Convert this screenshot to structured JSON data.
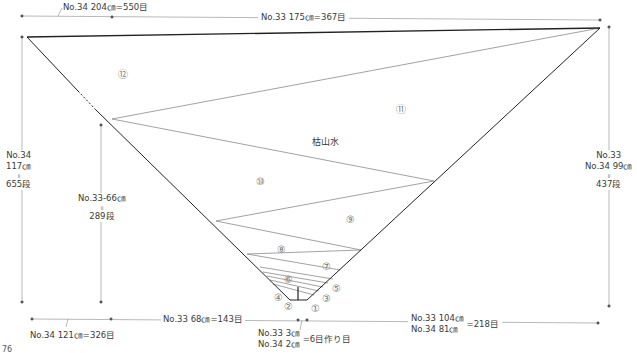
{
  "diagram": {
    "title": "枯山水",
    "page_number": "76",
    "top": {
      "left_label": "No.34  204㎝=550目",
      "right_label": "No.33  175㎝=367目"
    },
    "left_side": {
      "outer": {
        "line1": "No.34",
        "line2": "117㎝",
        "eq": "॥",
        "line3": "655段"
      },
      "inner": {
        "line1": "No.33-66㎝",
        "eq": "॥",
        "line2": "289段"
      }
    },
    "right_side": {
      "line1": "No.33",
      "line2": "No.34  99㎝",
      "eq": "॥",
      "line3": "437段"
    },
    "bottom": {
      "left_label": "No.34  121㎝=326目",
      "mid_label": "No.33  68㎝=143目",
      "cast_on": {
        "line1": "No.33  3㎝",
        "line2": "No.34  2㎝",
        "suffix": "=6目作り目"
      },
      "right": {
        "line1": "No.33  104㎝",
        "line2": "No.34  81㎝",
        "suffix": "=218目"
      }
    },
    "regions": [
      "①",
      "②",
      "③",
      "④",
      "⑤",
      "⑥",
      "⑦",
      "⑧",
      "⑨",
      "⑩",
      "⑪",
      "⑫"
    ],
    "colors": {
      "outline": "#222222",
      "stripe": "#8a8a8a",
      "dim": "#999999",
      "text": "#3a3a3a"
    }
  }
}
